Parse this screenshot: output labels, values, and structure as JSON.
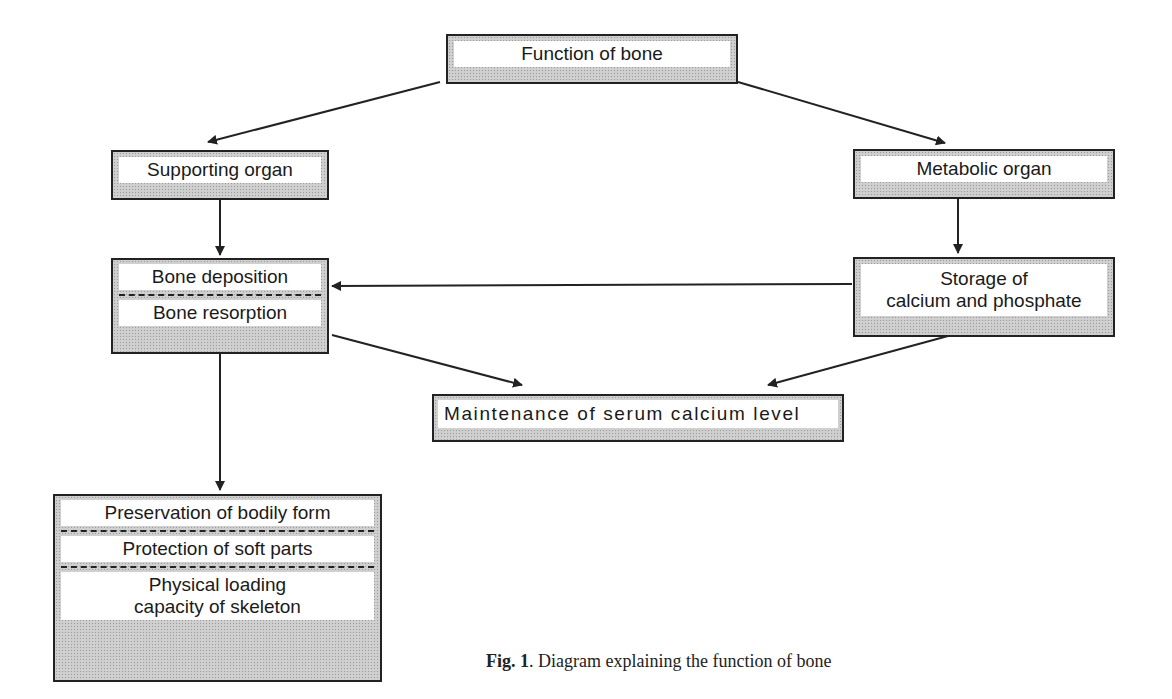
{
  "nodes": {
    "function_of_bone": "Function of bone",
    "supporting_organ": "Supporting organ",
    "metabolic_organ": "Metabolic organ",
    "bone_deposition": "Bone deposition",
    "bone_resorption": "Bone resorption",
    "storage_line1": "Storage of",
    "storage_line2": "calcium and phosphate",
    "maintenance": "Maintenance of serum calcium level",
    "preservation": "Preservation of bodily form",
    "protection": "Protection of soft parts",
    "physical_line1": "Physical loading",
    "physical_line2": "capacity of skeleton"
  },
  "edges": [
    {
      "from": "Function of bone",
      "to": "Supporting organ"
    },
    {
      "from": "Function of bone",
      "to": "Metabolic organ"
    },
    {
      "from": "Supporting organ",
      "to": "Bone deposition / Bone resorption"
    },
    {
      "from": "Metabolic organ",
      "to": "Storage of calcium and phosphate"
    },
    {
      "from": "Storage of calcium and phosphate",
      "to": "Bone deposition"
    },
    {
      "from": "Bone resorption",
      "to": "Maintenance of serum calcium level"
    },
    {
      "from": "Storage of calcium and phosphate",
      "to": "Maintenance of serum calcium level"
    },
    {
      "from": "Bone deposition / Bone resorption",
      "to": "Preservation / Protection / Physical loading"
    }
  ],
  "caption": {
    "label": "Fig. 1",
    "text": ". Diagram explaining the function of bone"
  }
}
